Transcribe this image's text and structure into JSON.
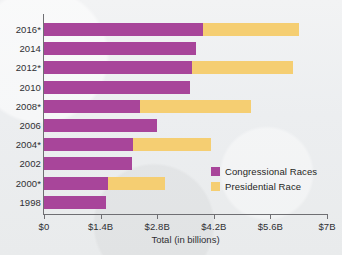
{
  "chart_data": {
    "type": "bar",
    "orientation": "horizontal",
    "stacked": true,
    "title": "",
    "xlabel": "Total (in billions)",
    "ylabel": "",
    "categories": [
      "2016*",
      "2014",
      "2012*",
      "2010",
      "2008*",
      "2006",
      "2004*",
      "2002",
      "2000*",
      "1998"
    ],
    "series": [
      {
        "name": "Congressional Races",
        "color": "#a8459a",
        "values": [
          3.93,
          3.75,
          3.66,
          3.61,
          2.37,
          2.79,
          2.2,
          2.18,
          1.58,
          1.53
        ]
      },
      {
        "name": "Presidential Race",
        "color": "#f5ce72",
        "values": [
          2.37,
          0,
          2.49,
          0,
          2.75,
          0,
          1.93,
          0,
          1.42,
          0
        ]
      }
    ],
    "totals": [
      6.3,
      3.75,
      6.15,
      3.61,
      5.12,
      2.79,
      4.13,
      2.18,
      3.0,
      1.53
    ],
    "xticks": [
      "$0",
      "$1.4B",
      "$2.8B",
      "$4.2B",
      "$5.6B",
      "$7B"
    ],
    "xtick_values": [
      0,
      1.4,
      2.8,
      4.2,
      5.6,
      7
    ],
    "xlim": [
      0,
      7
    ],
    "grid": false,
    "legend_position": "inside-right-lower",
    "legend": [
      {
        "label": "Congressional Races",
        "color": "#a8459a"
      },
      {
        "label": "Presidential Race",
        "color": "#f5ce72"
      }
    ]
  }
}
